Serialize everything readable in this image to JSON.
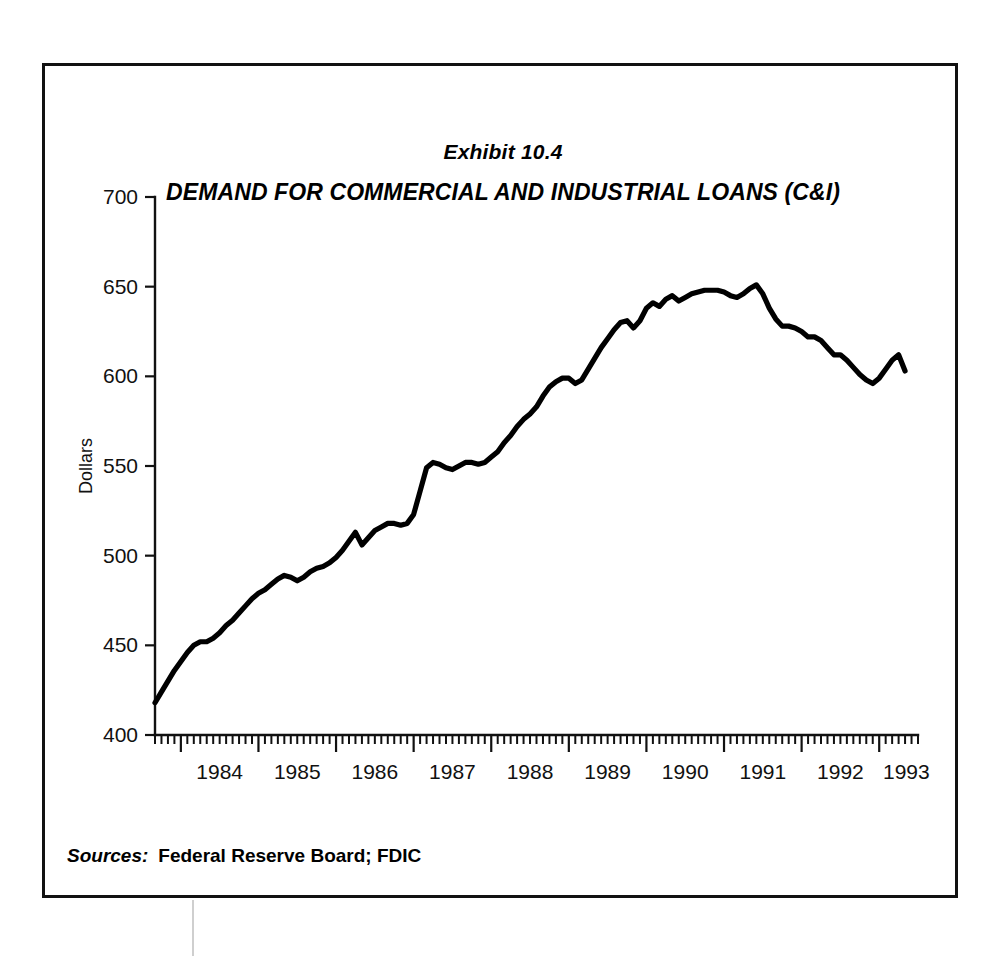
{
  "exhibit": {
    "label": "Exhibit 10.4",
    "title": "DEMAND FOR COMMERCIAL AND INDUSTRIAL LOANS (C&I)"
  },
  "sources": {
    "label": "Sources:",
    "text": "Federal Reserve Board; FDIC"
  },
  "axes": {
    "y_label": "Dollars",
    "y_ticks": [
      "400",
      "450",
      "500",
      "550",
      "600",
      "650",
      "700"
    ],
    "x_ticks": [
      "1984",
      "1985",
      "1986",
      "1987",
      "1988",
      "1989",
      "1990",
      "1991",
      "1992",
      "1993"
    ]
  },
  "colors": {
    "line": "#000000",
    "axis": "#111111",
    "frame": "#111111",
    "background": "#ffffff"
  },
  "chart_data": {
    "type": "line",
    "title": "DEMAND FOR COMMERCIAL AND INDUSTRIAL LOANS (C&I)",
    "subtitle": "Exhibit 10.4",
    "xlabel": "",
    "ylabel": "Dollars",
    "ylim": [
      400,
      700
    ],
    "ytick_step": 50,
    "xlim": [
      "1983-09",
      "1993-06"
    ],
    "grid": false,
    "legend": null,
    "source": "Federal Reserve Board; FDIC",
    "x_major_ticks": [
      "1984",
      "1985",
      "1986",
      "1987",
      "1988",
      "1989",
      "1990",
      "1991",
      "1992",
      "1993"
    ],
    "x_minor_tick_interval": "monthly",
    "series": [
      {
        "name": "C&I Loans Outstanding",
        "units": "billions of dollars",
        "x": [
          "1983-09",
          "1983-10",
          "1983-11",
          "1983-12",
          "1984-01",
          "1984-02",
          "1984-03",
          "1984-04",
          "1984-05",
          "1984-06",
          "1984-07",
          "1984-08",
          "1984-09",
          "1984-10",
          "1984-11",
          "1984-12",
          "1985-01",
          "1985-02",
          "1985-03",
          "1985-04",
          "1985-05",
          "1985-06",
          "1985-07",
          "1985-08",
          "1985-09",
          "1985-10",
          "1985-11",
          "1985-12",
          "1986-01",
          "1986-02",
          "1986-03",
          "1986-04",
          "1986-05",
          "1986-06",
          "1986-07",
          "1986-08",
          "1986-09",
          "1986-10",
          "1986-11",
          "1986-12",
          "1987-01",
          "1987-02",
          "1987-03",
          "1987-04",
          "1987-05",
          "1987-06",
          "1987-07",
          "1987-08",
          "1987-09",
          "1987-10",
          "1987-11",
          "1987-12",
          "1988-01",
          "1988-02",
          "1988-03",
          "1988-04",
          "1988-05",
          "1988-06",
          "1988-07",
          "1988-08",
          "1988-09",
          "1988-10",
          "1988-11",
          "1988-12",
          "1989-01",
          "1989-02",
          "1989-03",
          "1989-04",
          "1989-05",
          "1989-06",
          "1989-07",
          "1989-08",
          "1989-09",
          "1989-10",
          "1989-11",
          "1989-12",
          "1990-01",
          "1990-02",
          "1990-03",
          "1990-04",
          "1990-05",
          "1990-06",
          "1990-07",
          "1990-08",
          "1990-09",
          "1990-10",
          "1990-11",
          "1990-12",
          "1991-01",
          "1991-02",
          "1991-03",
          "1991-04",
          "1991-05",
          "1991-06",
          "1991-07",
          "1991-08",
          "1991-09",
          "1991-10",
          "1991-11",
          "1991-12",
          "1992-01",
          "1992-02",
          "1992-03",
          "1992-04",
          "1992-05",
          "1992-06",
          "1992-07",
          "1992-08",
          "1992-09",
          "1992-10",
          "1992-11",
          "1992-12",
          "1993-01",
          "1993-02",
          "1993-03",
          "1993-04",
          "1993-05"
        ],
        "values": [
          418,
          424,
          430,
          436,
          441,
          446,
          450,
          452,
          452,
          454,
          457,
          461,
          464,
          468,
          472,
          476,
          479,
          481,
          484,
          487,
          489,
          488,
          486,
          488,
          491,
          493,
          494,
          496,
          499,
          503,
          508,
          513,
          506,
          510,
          514,
          516,
          518,
          518,
          517,
          518,
          523,
          536,
          549,
          552,
          551,
          549,
          548,
          550,
          552,
          552,
          551,
          552,
          555,
          558,
          563,
          567,
          572,
          576,
          579,
          583,
          589,
          594,
          597,
          599,
          599,
          596,
          598,
          604,
          610,
          616,
          621,
          626,
          630,
          631,
          627,
          631,
          638,
          641,
          639,
          643,
          645,
          642,
          644,
          646,
          647,
          648,
          648,
          648,
          647,
          645,
          644,
          646,
          649,
          651,
          646,
          638,
          632,
          628,
          628,
          627,
          625,
          622,
          622,
          620,
          616,
          612,
          612,
          609,
          605,
          601,
          598,
          596,
          599,
          604,
          609,
          612,
          603
        ]
      }
    ]
  }
}
